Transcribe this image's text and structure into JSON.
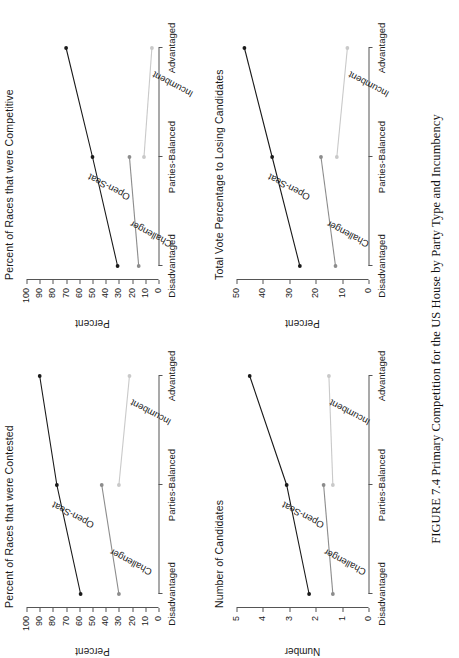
{
  "figure": {
    "caption": "FIGURE 7.4  Primary Competition for the US House by Party Type and Incumbency",
    "categories": [
      "Disadvantaged",
      "Parties-Balanced",
      "Advantaged"
    ],
    "series_names": [
      "Open-Seat",
      "Challenger",
      "Incumbent"
    ],
    "colors": {
      "open_seat": "#1a1a1a",
      "challenger": "#8c8c8c",
      "incumbent": "#c9c9c9",
      "axis": "#555555",
      "text": "#1a1a1a"
    }
  },
  "chart_data": [
    {
      "panel_id": "contested",
      "type": "line",
      "title": "Percent of Races that were Contested",
      "xlabel": "",
      "ylabel": "Percent",
      "categories": [
        "Disadvantaged",
        "Parties-Balanced",
        "Advantaged"
      ],
      "ylim": [
        0,
        100
      ],
      "yticks": [
        0,
        10,
        20,
        30,
        40,
        50,
        60,
        70,
        80,
        90,
        100
      ],
      "grid": false,
      "legend": "inline-labels",
      "series": [
        {
          "name": "Open-Seat",
          "values": [
            59,
            77,
            90
          ],
          "color": "#1a1a1a",
          "label_at": 1
        },
        {
          "name": "Challenger",
          "values": [
            30,
            43,
            null
          ],
          "color": "#8c8c8c",
          "label_at": 0
        },
        {
          "name": "Incumbent",
          "values": [
            null,
            30,
            22
          ],
          "color": "#c9c9c9",
          "label_at": 2
        }
      ]
    },
    {
      "panel_id": "competitive",
      "type": "line",
      "title": "Percent of Races that were Competitive",
      "xlabel": "",
      "ylabel": "Percent",
      "categories": [
        "Disadvantaged",
        "Parties-Balanced",
        "Advantaged"
      ],
      "ylim": [
        0,
        100
      ],
      "yticks": [
        0,
        10,
        20,
        30,
        40,
        50,
        60,
        70,
        80,
        90,
        100
      ],
      "grid": false,
      "legend": "inline-labels",
      "series": [
        {
          "name": "Open-Seat",
          "values": [
            31,
            50,
            70
          ],
          "color": "#1a1a1a",
          "label_at": 1
        },
        {
          "name": "Challenger",
          "values": [
            15,
            22,
            null
          ],
          "color": "#8c8c8c",
          "label_at": 0
        },
        {
          "name": "Incumbent",
          "values": [
            null,
            11,
            5
          ],
          "color": "#c9c9c9",
          "label_at": 2
        }
      ]
    },
    {
      "panel_id": "number",
      "type": "line",
      "title": "Number of Candidates",
      "xlabel": "",
      "ylabel": "Number",
      "categories": [
        "Disadvantaged",
        "Parties-Balanced",
        "Advantaged"
      ],
      "ylim": [
        0,
        5
      ],
      "yticks": [
        0,
        1,
        2,
        3,
        4,
        5
      ],
      "grid": false,
      "legend": "inline-labels",
      "series": [
        {
          "name": "Open-Seat",
          "values": [
            2.25,
            3.1,
            4.5
          ],
          "color": "#1a1a1a",
          "label_at": 1
        },
        {
          "name": "Challenger",
          "values": [
            1.35,
            1.7,
            null
          ],
          "color": "#8c8c8c",
          "label_at": 0
        },
        {
          "name": "Incumbent",
          "values": [
            null,
            1.35,
            1.5
          ],
          "color": "#c9c9c9",
          "label_at": 2
        }
      ]
    },
    {
      "panel_id": "votepct",
      "type": "line",
      "title": "Total Vote Percentage to Losing Candidates",
      "xlabel": "",
      "ylabel": "Percent",
      "categories": [
        "Disadvantaged",
        "Parties-Balanced",
        "Advantaged"
      ],
      "ylim": [
        0,
        50
      ],
      "yticks": [
        0,
        10,
        20,
        30,
        40,
        50
      ],
      "grid": false,
      "legend": "inline-labels",
      "series": [
        {
          "name": "Open-Seat",
          "values": [
            26,
            36.5,
            47
          ],
          "color": "#1a1a1a",
          "label_at": 1
        },
        {
          "name": "Challenger",
          "values": [
            12.5,
            18,
            null
          ],
          "color": "#8c8c8c",
          "label_at": 0
        },
        {
          "name": "Incumbent",
          "values": [
            null,
            12,
            8
          ],
          "color": "#c9c9c9",
          "label_at": 2
        }
      ]
    }
  ]
}
